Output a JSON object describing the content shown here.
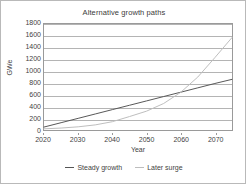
{
  "chart_data": {
    "type": "line",
    "title": "Alternative growth paths",
    "xlabel": "Year",
    "ylabel": "GWe",
    "xlim": [
      2020,
      2075
    ],
    "ylim": [
      0,
      1800
    ],
    "grid": true,
    "grid_axis": "y",
    "legend_position": "bottom",
    "x_ticks": [
      2020,
      2030,
      2040,
      2050,
      2060,
      2070
    ],
    "y_ticks": [
      0,
      200,
      400,
      600,
      800,
      1000,
      1200,
      1400,
      1600,
      1800
    ],
    "x": [
      2020,
      2025,
      2030,
      2035,
      2040,
      2045,
      2050,
      2055,
      2060,
      2065,
      2070,
      2075
    ],
    "series": [
      {
        "name": "Steady growth",
        "color": "#555555",
        "values": [
          50,
          124,
          198,
          272,
          346,
          420,
          494,
          568,
          642,
          716,
          790,
          860
        ]
      },
      {
        "name": "Later surge",
        "color": "#bdbdbd",
        "values": [
          20,
          33,
          54,
          87,
          141,
          228,
          320,
          450,
          640,
          900,
          1230,
          1570
        ]
      }
    ]
  },
  "legend": {
    "items": [
      {
        "label": "Steady growth",
        "color": "#555555"
      },
      {
        "label": "Later surge",
        "color": "#bdbdbd"
      }
    ]
  }
}
